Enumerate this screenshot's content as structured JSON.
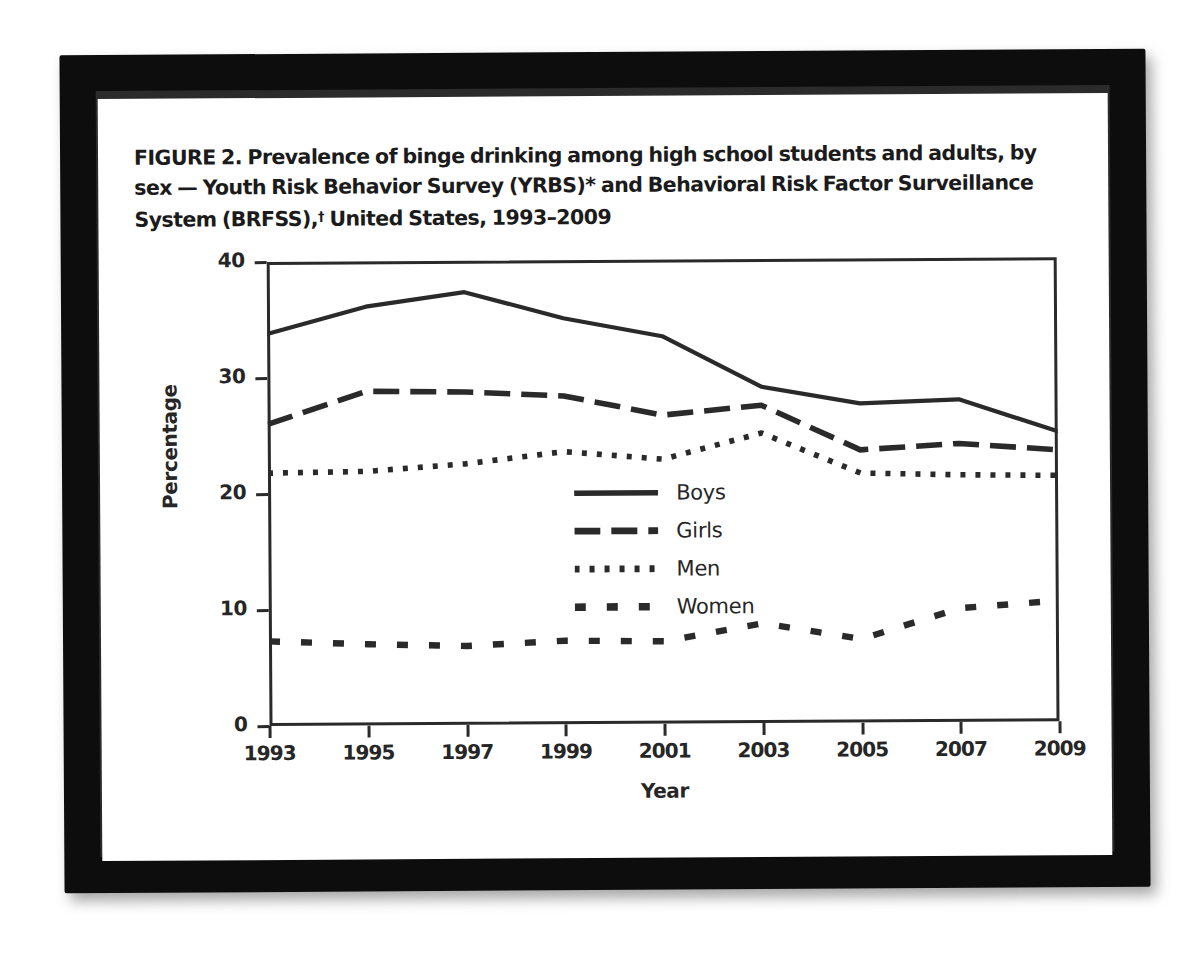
{
  "figure": {
    "title_line1": "FIGURE 2. Prevalence of binge drinking among high school students and adults, by",
    "title_line2_a": "sex — Youth Risk Behavior Survey (YRBS)* and Behavioral Risk Factor Surveillance",
    "title_line3_a": "System (BRFSS),",
    "title_line3_dagger": "†",
    "title_line3_b": " United States, 1993–2009"
  },
  "chart_data": {
    "type": "line",
    "xlabel": "Year",
    "ylabel": "Percentage",
    "xlim": [
      1993,
      2009
    ],
    "ylim": [
      0,
      40
    ],
    "grid": false,
    "legend_position": "center",
    "x": [
      1993,
      1995,
      1997,
      1999,
      2001,
      2003,
      2005,
      2007,
      2009
    ],
    "xticks": [
      "1993",
      "1995",
      "1997",
      "1999",
      "2001",
      "2003",
      "2005",
      "2007",
      "2009"
    ],
    "yticks": [
      "0",
      "10",
      "20",
      "30",
      "40"
    ],
    "ytick_values": [
      0,
      10,
      20,
      30,
      40
    ],
    "series": [
      {
        "name": "Boys",
        "style": "solid",
        "color": "#2a2a2a",
        "values": [
          33.8,
          36.1,
          37.3,
          35.0,
          33.4,
          29.0,
          27.5,
          27.8,
          25.0
        ]
      },
      {
        "name": "Girls",
        "style": "long-dash",
        "color": "#2a2a2a",
        "values": [
          26.0,
          28.8,
          28.7,
          28.3,
          26.6,
          27.4,
          23.5,
          24.0,
          23.4
        ]
      },
      {
        "name": "Men",
        "style": "dotted",
        "color": "#2a2a2a",
        "values": [
          21.8,
          21.9,
          22.5,
          23.5,
          22.8,
          25.0,
          21.5,
          21.3,
          21.2
        ]
      },
      {
        "name": "Women",
        "style": "dashed-wide",
        "color": "#2a2a2a",
        "values": [
          7.3,
          7.0,
          6.8,
          7.2,
          7.1,
          8.6,
          7.2,
          9.8,
          10.4
        ]
      }
    ]
  },
  "legend": {
    "items": [
      {
        "label": "Boys"
      },
      {
        "label": "Girls"
      },
      {
        "label": "Men"
      },
      {
        "label": "Women"
      }
    ]
  },
  "colors": {
    "ink": "#2a2a2a",
    "frame": "#0d0d0d",
    "page": "#ffffff"
  }
}
